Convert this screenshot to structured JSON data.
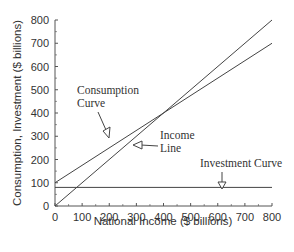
{
  "chart_data": {
    "type": "line",
    "title": "",
    "xlabel": "National Income ($ billions)",
    "ylabel": "Consumption, Investment ($ billions)",
    "xlim": [
      0,
      800
    ],
    "ylim": [
      0,
      800
    ],
    "x_ticks": [
      "0",
      "100",
      "200",
      "300",
      "400",
      "500",
      "600",
      "700",
      "800"
    ],
    "y_ticks": [
      "0",
      "100",
      "200",
      "300",
      "400",
      "500",
      "600",
      "700",
      "800"
    ],
    "grid": false,
    "series": [
      {
        "name": "Consumption Curve",
        "x": [
          0,
          800
        ],
        "values": [
          100,
          700
        ]
      },
      {
        "name": "Income Line",
        "x": [
          0,
          800
        ],
        "values": [
          0,
          800
        ]
      },
      {
        "name": "Investment Curve",
        "x": [
          0,
          800
        ],
        "values": [
          80,
          80
        ]
      }
    ],
    "annotations": [
      {
        "text": "Consumption Curve",
        "points_to": [
          200,
          280
        ]
      },
      {
        "text": "Income Line",
        "points_to": [
          300,
          270
        ]
      },
      {
        "text": "Investment Curve",
        "points_to": [
          620,
          80
        ]
      }
    ]
  },
  "labels": {
    "xlabel": "National Income ($ billions)",
    "ylabel": "Consumption, Investment ($ billions)",
    "consumption_1": "Consumption",
    "consumption_2": "Curve",
    "income_1": "Income",
    "income_2": "Line",
    "investment": "Investment Curve"
  }
}
